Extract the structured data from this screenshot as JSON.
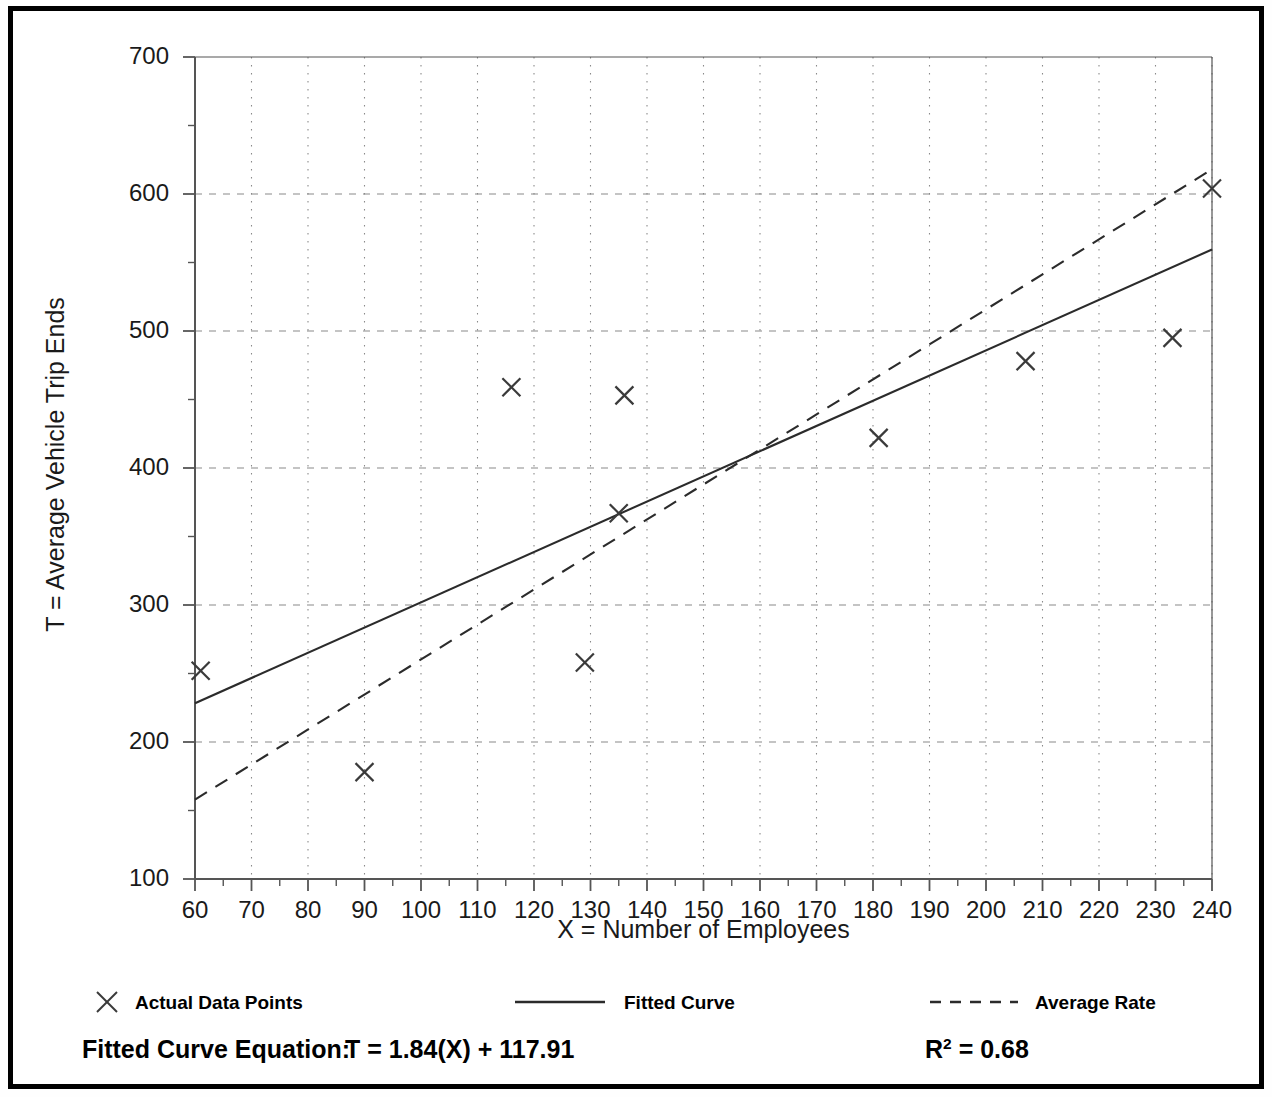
{
  "chart_data": {
    "type": "scatter",
    "title": "",
    "xlabel": "X = Number of Employees",
    "ylabel": "T = Average Vehicle Trip Ends",
    "xlim": [
      60,
      240
    ],
    "ylim": [
      100,
      700
    ],
    "xticks": [
      60,
      70,
      80,
      90,
      100,
      110,
      120,
      130,
      140,
      150,
      160,
      170,
      180,
      190,
      200,
      210,
      220,
      230,
      240
    ],
    "yticks": [
      100,
      200,
      300,
      400,
      500,
      600,
      700
    ],
    "xtick_labels": [
      "60",
      "70",
      "80",
      "90",
      "100",
      "110",
      "120",
      "130",
      "140",
      "150",
      "160",
      "170",
      "180",
      "190",
      "200",
      "210",
      "220",
      "230",
      "240"
    ],
    "ytick_labels": [
      "100",
      "200",
      "300",
      "400",
      "500",
      "600",
      "700"
    ],
    "x_minor_step": 5,
    "y_minor_step": 50,
    "grid": true,
    "grid_style": "dotted",
    "legend_position": "below-axes",
    "series": [
      {
        "name": "Actual Data Points",
        "type": "scatter",
        "marker": "x",
        "points": [
          [
            61,
            252
          ],
          [
            90,
            178
          ],
          [
            116,
            459
          ],
          [
            129,
            258
          ],
          [
            135,
            367
          ],
          [
            136,
            453
          ],
          [
            181,
            422
          ],
          [
            207,
            478
          ],
          [
            233,
            495
          ],
          [
            240,
            604
          ]
        ]
      },
      {
        "name": "Fitted Curve",
        "type": "line",
        "style": "solid",
        "endpoints": [
          [
            60,
            228.3
          ],
          [
            240,
            559.5
          ]
        ],
        "equation_slope": 1.84,
        "equation_intercept": 117.91
      },
      {
        "name": "Average Rate",
        "type": "line",
        "style": "dashed",
        "endpoints": [
          [
            60,
            158
          ],
          [
            240,
            618
          ]
        ]
      }
    ],
    "annotations": {
      "equation_label": "Fitted Curve Equation:",
      "equation_value": "T = 1.84(X) + 117.91",
      "r_squared_symbol": "R",
      "r_squared_exponent": "2",
      "r_squared_value": "= 0.68"
    }
  },
  "legend": {
    "items": [
      {
        "label": "Actual Data Points",
        "icon": "x-marker-icon"
      },
      {
        "label": "Fitted Curve",
        "icon": "solid-line-icon"
      },
      {
        "label": "Average Rate",
        "icon": "dashed-line-icon"
      }
    ]
  },
  "colors": {
    "axis": "#555555",
    "grid": "#8a8a8a",
    "marker": "#3a3a3a",
    "line": "#2b2b2b",
    "frame": "#000000",
    "text": "#1a1a1a"
  }
}
